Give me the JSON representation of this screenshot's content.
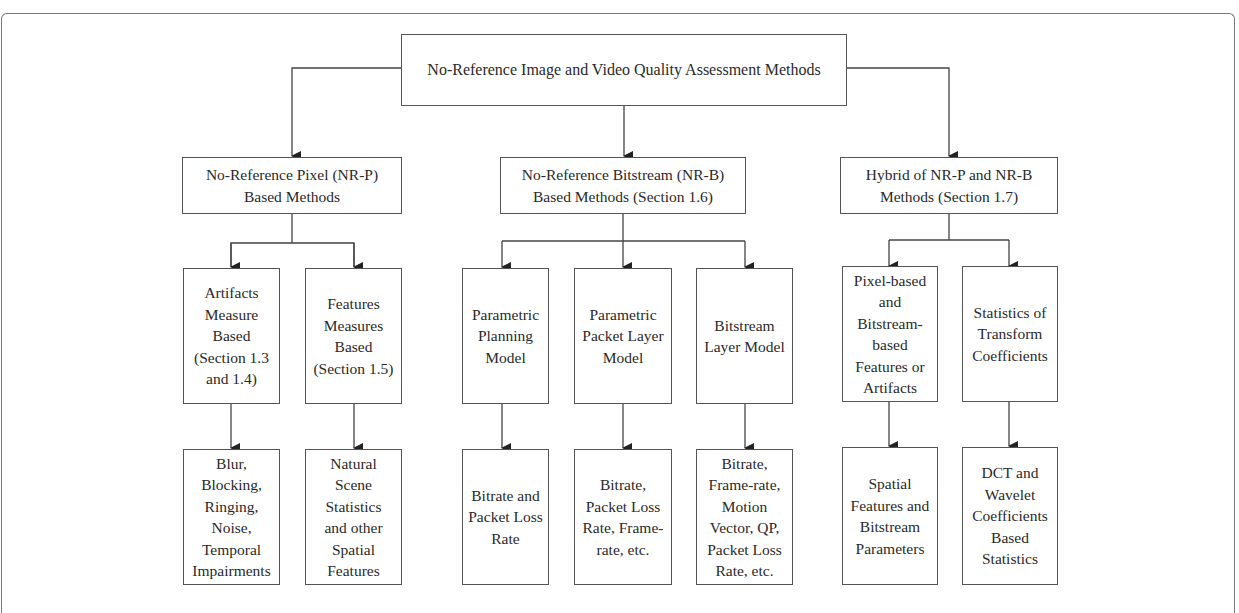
{
  "diagram": {
    "root": {
      "label": "No-Reference Image and Video Quality Assessment Methods"
    },
    "level1": [
      {
        "id": "nrp",
        "label": "No-Reference Pixel (NR-P)\nBased Methods"
      },
      {
        "id": "nrb",
        "label": "No-Reference Bitstream (NR-B)\nBased Methods (Section 1.6)"
      },
      {
        "id": "hybrid",
        "label": "Hybrid of NR-P and NR-B\nMethods (Section 1.7)"
      }
    ],
    "level2": [
      {
        "parent": "nrp",
        "label": "Artifacts\nMeasure\nBased\n(Section 1.3\nand 1.4)"
      },
      {
        "parent": "nrp",
        "label": "Features\nMeasures\nBased\n(Section 1.5)"
      },
      {
        "parent": "nrb",
        "label": "Parametric\nPlanning\nModel"
      },
      {
        "parent": "nrb",
        "label": "Parametric\nPacket Layer\nModel"
      },
      {
        "parent": "nrb",
        "label": "Bitstream\nLayer Model"
      },
      {
        "parent": "hybrid",
        "label": "Pixel-based\nand\nBitstream-\nbased\nFeatures or\nArtifacts"
      },
      {
        "parent": "hybrid",
        "label": "Statistics of\nTransform\nCoefficients"
      }
    ],
    "level3": [
      {
        "label": "Blur,\nBlocking,\nRinging,\nNoise,\nTemporal\nImpairments"
      },
      {
        "label": "Natural\nScene\nStatistics\nand other\nSpatial\nFeatures"
      },
      {
        "label": "Bitrate and\nPacket Loss\nRate"
      },
      {
        "label": "Bitrate,\nPacket Loss\nRate, Frame-\nrate, etc."
      },
      {
        "label": "Bitrate,\nFrame-rate,\nMotion\nVector, QP,\nPacket Loss\nRate, etc."
      },
      {
        "label": "Spatial\nFeatures and\nBitstream\nParameters"
      },
      {
        "label": "DCT and\nWavelet\nCoefficients\nBased\nStatistics"
      }
    ]
  },
  "colors": {
    "line": "#444444",
    "border": "#555555",
    "text": "#2a2a2a",
    "background": "#ffffff"
  }
}
